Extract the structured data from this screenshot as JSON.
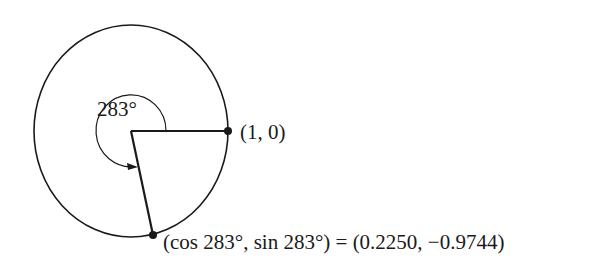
{
  "figure": {
    "type": "unit-circle-angle",
    "angle_degrees": 283,
    "angle_label": "283°",
    "points": [
      {
        "id": "start",
        "label": "(1, 0)"
      },
      {
        "id": "terminal",
        "label": "(cos 283°, sin 283°) = (0.2250, −0.9744)"
      }
    ],
    "colors": {
      "stroke": "#1a1a1a",
      "background": "#ffffff"
    }
  }
}
